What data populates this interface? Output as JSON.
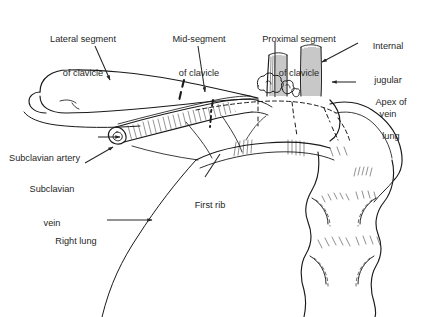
{
  "figure": {
    "background_color": "#ffffff",
    "ink_color": "#1a1a1a",
    "text_color": "#262626",
    "width": 425,
    "height": 317
  },
  "labels": {
    "lateral_segment": {
      "line1": "Lateral segment",
      "line2": "of clavicle"
    },
    "mid_segment": {
      "line1": "Mid-segment",
      "line2": "of clavicle"
    },
    "proximal_segment": {
      "line1": "Proximal segment",
      "line2": "of clavicle"
    },
    "internal_jugular_vein": {
      "line1": "Internal",
      "line2": "jugular",
      "line3": "vein"
    },
    "apex_of_lung": {
      "line1": "Apex of",
      "line2": "lung"
    },
    "subclavian_artery": {
      "line1": "Subclavian artery"
    },
    "subclavian_vein": {
      "line1": "Subclavian",
      "line2": "vein"
    },
    "first_rib": {
      "line1": "First rib"
    },
    "right_lung": {
      "line1": "Right lung"
    }
  }
}
